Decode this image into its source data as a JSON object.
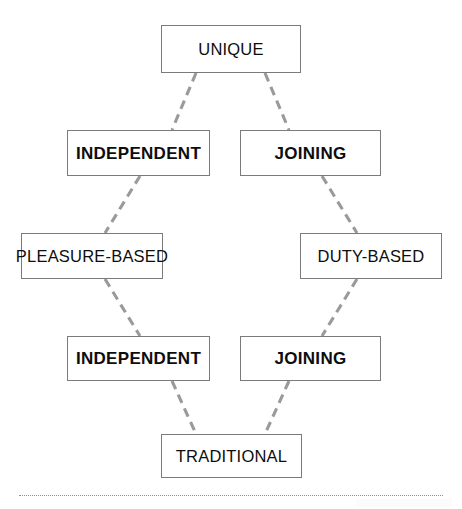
{
  "diagram": {
    "type": "flowchart",
    "title": "",
    "orientation": "vertical-diamond",
    "canvas": {
      "width": 462,
      "height": 509,
      "background": "#ffffff"
    },
    "style": {
      "box_border_color": "#7b7b7b",
      "box_fill_color": "#ffffff",
      "text_color": "#0d0d0d",
      "connector_color": "#9a9a9a",
      "connector_style": "dashed",
      "separator_color": "#8e8e8e"
    },
    "nodes": [
      {
        "id": "unique",
        "label": "UNIQUE",
        "emphasis": "regular",
        "row": 1,
        "column": "center",
        "x": 161,
        "y": 25,
        "width": 140,
        "height": 48
      },
      {
        "id": "independent-upper",
        "label": "INDEPENDENT",
        "emphasis": "bold",
        "row": 2,
        "column": "left",
        "x": 67,
        "y": 130,
        "width": 143,
        "height": 46
      },
      {
        "id": "joining-upper",
        "label": "JOINING",
        "emphasis": "bold",
        "row": 2,
        "column": "right",
        "x": 240,
        "y": 130,
        "width": 141,
        "height": 46
      },
      {
        "id": "pleasure-based",
        "label": "PLEASURE-BASED",
        "emphasis": "regular",
        "row": 3,
        "column": "far-left",
        "x": 21,
        "y": 233,
        "width": 142,
        "height": 46
      },
      {
        "id": "duty-based",
        "label": "DUTY-BASED",
        "emphasis": "regular",
        "row": 3,
        "column": "far-right",
        "x": 300,
        "y": 233,
        "width": 142,
        "height": 46
      },
      {
        "id": "independent-lower",
        "label": "INDEPENDENT",
        "emphasis": "bold",
        "row": 4,
        "column": "left",
        "x": 67,
        "y": 336,
        "width": 143,
        "height": 45
      },
      {
        "id": "joining-lower",
        "label": "JOINING",
        "emphasis": "bold",
        "row": 4,
        "column": "right",
        "x": 240,
        "y": 336,
        "width": 141,
        "height": 45
      },
      {
        "id": "traditional",
        "label": "TRADITIONAL",
        "emphasis": "regular",
        "row": 5,
        "column": "center",
        "x": 161,
        "y": 434,
        "width": 141,
        "height": 44
      }
    ],
    "edges": [
      {
        "id": "edge-unique-independent-upper",
        "from": "unique",
        "to": "independent-upper",
        "x1": 196,
        "y1": 73,
        "x2": 172,
        "y2": 130
      },
      {
        "id": "edge-unique-joining-upper",
        "from": "unique",
        "to": "joining-upper",
        "x1": 265,
        "y1": 73,
        "x2": 289,
        "y2": 130
      },
      {
        "id": "edge-independent-upper-pleasure-based",
        "from": "independent-upper",
        "to": "pleasure-based",
        "x1": 140,
        "y1": 176,
        "x2": 105,
        "y2": 233
      },
      {
        "id": "edge-joining-upper-duty-based",
        "from": "joining-upper",
        "to": "duty-based",
        "x1": 322,
        "y1": 176,
        "x2": 357,
        "y2": 233
      },
      {
        "id": "edge-pleasure-based-independent-lower",
        "from": "pleasure-based",
        "to": "independent-lower",
        "x1": 105,
        "y1": 279,
        "x2": 140,
        "y2": 336
      },
      {
        "id": "edge-duty-based-joining-lower",
        "from": "duty-based",
        "to": "joining-lower",
        "x1": 357,
        "y1": 279,
        "x2": 322,
        "y2": 336
      },
      {
        "id": "edge-independent-lower-traditional",
        "from": "independent-lower",
        "to": "traditional",
        "x1": 172,
        "y1": 381,
        "x2": 196,
        "y2": 434
      },
      {
        "id": "edge-joining-lower-traditional",
        "from": "joining-lower",
        "to": "traditional",
        "x1": 289,
        "y1": 381,
        "x2": 265,
        "y2": 434
      }
    ],
    "separator": {
      "x": 19,
      "y": 495,
      "width": 424,
      "style": "dotted"
    }
  }
}
